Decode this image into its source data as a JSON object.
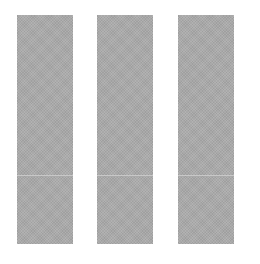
{
  "panels": [
    {
      "id": "left",
      "left": 17,
      "color": "#a9a9a9"
    },
    {
      "id": "middle",
      "left": 97,
      "color": "#a9a9a9"
    },
    {
      "id": "right",
      "left": 178,
      "color": "#a9a9a9"
    }
  ],
  "background": "#ffffff"
}
